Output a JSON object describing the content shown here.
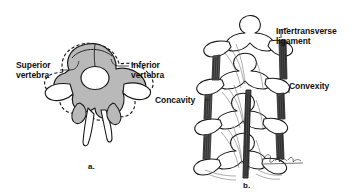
{
  "figure": {
    "background_color": "#ffffff",
    "ink_color": "#1a1a1a",
    "bone_fill_color": "#b9b9b9",
    "ligament_color": "#2b2b2b"
  },
  "panel_a": {
    "caption": "a.",
    "labels": [
      {
        "id": "superior-vertebra",
        "text": "Superior\nvertebra"
      },
      {
        "id": "inferior-vertebra",
        "text": "Inferior\nvertebra"
      }
    ]
  },
  "panel_b": {
    "caption": "b.",
    "labels": [
      {
        "id": "intertransverse-ligament",
        "text": "Intertransverse\nligament"
      },
      {
        "id": "convexity",
        "text": "Convexity"
      },
      {
        "id": "concavity",
        "text": "Concavity"
      }
    ],
    "signature": "artist-signature"
  }
}
